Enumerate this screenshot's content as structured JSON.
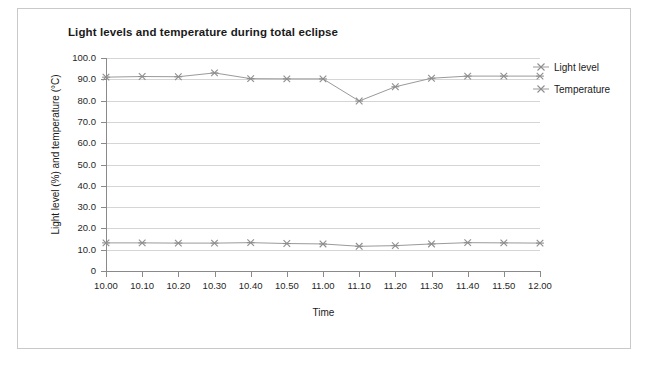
{
  "chart_data": {
    "type": "line",
    "title": "Light levels and temperature during total eclipse",
    "xlabel": "Time",
    "ylabel": "Light level (%) and temperature (°C)",
    "categories": [
      "10.00",
      "10.10",
      "10.20",
      "10.30",
      "10.40",
      "10.50",
      "11.00",
      "11.10",
      "11.20",
      "11.30",
      "11.40",
      "11.50",
      "12.00"
    ],
    "ylim": [
      0,
      100
    ],
    "ytick_labels": [
      "100.0",
      "90.0",
      "80.0",
      "70.0",
      "60.0",
      "50.0",
      "40.0",
      "30.0",
      "20.0",
      "10.0",
      "0"
    ],
    "ytick_values": [
      100,
      90,
      80,
      70,
      60,
      50,
      40,
      30,
      20,
      10,
      0
    ],
    "grid": true,
    "legend_position": "right",
    "marker": "asterisk",
    "series": [
      {
        "name": "Light level",
        "color": "#9a9a9a",
        "values": [
          91.0,
          91.3,
          91.2,
          93.0,
          90.3,
          90.2,
          90.2,
          79.8,
          86.5,
          90.5,
          91.5,
          91.5,
          91.5
        ]
      },
      {
        "name": "Temperature",
        "color": "#9a9a9a",
        "values": [
          13.2,
          13.2,
          13.1,
          13.1,
          13.3,
          12.9,
          12.7,
          11.6,
          11.9,
          12.7,
          13.3,
          13.2,
          13.1
        ]
      }
    ]
  },
  "legend": {
    "items": [
      {
        "label": "Light level"
      },
      {
        "label": "Temperature"
      }
    ]
  }
}
